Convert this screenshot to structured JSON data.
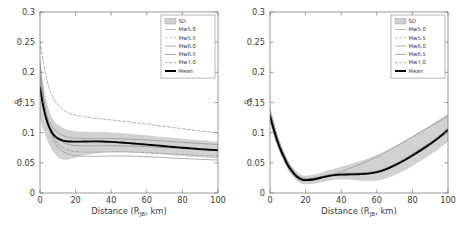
{
  "figure": {
    "background": "#ffffff",
    "panel_count": 2
  },
  "style": {
    "sd_band_color": "#b4b4b4",
    "mean_color": "#000000",
    "curve_color": "#9a9a9a",
    "axis_color": "#808080",
    "text_color": "#3a3a3a",
    "legend_border": "#9a9a9a"
  },
  "legend": {
    "position": "top-right",
    "entries": [
      {
        "label": "SD",
        "style": "band",
        "color": "#b4b4b4"
      },
      {
        "label": "Mw5.0",
        "style": "solid",
        "color": "#a8a8a8"
      },
      {
        "label": "Mw5.5",
        "style": "dashed",
        "color": "#a8a8a8"
      },
      {
        "label": "Mw6.0",
        "style": "solid",
        "color": "#9a9a9a"
      },
      {
        "label": "Mw6.5",
        "style": "solid",
        "color": "#8e8e8e"
      },
      {
        "label": "Mw7.0",
        "style": "dashed",
        "color": "#8e8e8e"
      },
      {
        "label": "Mean",
        "style": "thick-solid",
        "color": "#000000"
      }
    ]
  },
  "axes": {
    "x": {
      "label_main": "Distance (R",
      "label_sub": "JB",
      "label_tail": ", km)",
      "ticks": [
        0,
        20,
        40,
        60,
        80,
        100
      ],
      "tick_labels": [
        "0",
        "20",
        "40",
        "60",
        "80",
        "100"
      ],
      "min": 0,
      "max": 100
    },
    "y": {
      "label_symbol": "σ",
      "label_superscript": "2",
      "ticks": [
        0,
        0.05,
        0.1,
        0.15,
        0.2,
        0.25,
        0.3
      ],
      "tick_labels": [
        "0",
        "0.05",
        "0.1",
        "0.15",
        "0.2",
        "0.25",
        "0.3"
      ],
      "min": 0,
      "max": 0.3
    }
  },
  "chart_data": [
    {
      "type": "line",
      "panel": "left",
      "title": "",
      "xlabel": "Distance (RJB, km)",
      "ylabel": "σ²",
      "xlim": [
        0,
        100
      ],
      "ylim": [
        0,
        0.3
      ],
      "grid": false,
      "legend_position": "top-right",
      "x": [
        0,
        2,
        4,
        6,
        8,
        10,
        12,
        15,
        18,
        20,
        25,
        30,
        35,
        40,
        45,
        50,
        55,
        60,
        65,
        70,
        75,
        80,
        85,
        90,
        95,
        100
      ],
      "series": [
        {
          "name": "Mean",
          "style": "thick-solid",
          "values": [
            0.175,
            0.141,
            0.118,
            0.104,
            0.095,
            0.0905,
            0.0878,
            0.0858,
            0.0852,
            0.0851,
            0.0853,
            0.0855,
            0.0853,
            0.0847,
            0.0838,
            0.0827,
            0.0815,
            0.0802,
            0.0789,
            0.0776,
            0.0763,
            0.0751,
            0.0739,
            0.0728,
            0.0718,
            0.0709
          ]
        },
        {
          "name": "Mw5.0",
          "style": "solid",
          "values": [
            0.215,
            0.158,
            0.122,
            0.099,
            0.085,
            0.0762,
            0.0706,
            0.0654,
            0.0628,
            0.0619,
            0.0609,
            0.0608,
            0.0611,
            0.0613,
            0.0613,
            0.0611,
            0.0607,
            0.0602,
            0.0595,
            0.0588,
            0.058,
            0.0572,
            0.0565,
            0.0558,
            0.0552,
            0.0547
          ]
        },
        {
          "name": "Mw5.5",
          "style": "dashed",
          "values": [
            0.209,
            0.157,
            0.124,
            0.103,
            0.0901,
            0.0819,
            0.0766,
            0.0718,
            0.0694,
            0.0686,
            0.0678,
            0.0678,
            0.0681,
            0.0683,
            0.0683,
            0.068,
            0.0676,
            0.067,
            0.0663,
            0.0655,
            0.0647,
            0.0639,
            0.0631,
            0.0624,
            0.0617,
            0.0611
          ]
        },
        {
          "name": "Mw6.0",
          "style": "solid",
          "values": [
            0.196,
            0.152,
            0.125,
            0.108,
            0.0972,
            0.0903,
            0.0857,
            0.0815,
            0.0794,
            0.0787,
            0.078,
            0.0781,
            0.0783,
            0.0784,
            0.0783,
            0.078,
            0.0775,
            0.0768,
            0.076,
            0.0751,
            0.0742,
            0.0733,
            0.0724,
            0.0716,
            0.0708,
            0.0701
          ]
        },
        {
          "name": "Mw6.5",
          "style": "solid",
          "values": [
            0.182,
            0.148,
            0.127,
            0.114,
            0.1055,
            0.1001,
            0.0965,
            0.0932,
            0.0915,
            0.0909,
            0.0903,
            0.0903,
            0.0904,
            0.0903,
            0.09,
            0.0895,
            0.0888,
            0.088,
            0.087,
            0.086,
            0.085,
            0.084,
            0.083,
            0.082,
            0.0811,
            0.0803
          ]
        },
        {
          "name": "Mw7.0",
          "style": "dashed",
          "values": [
            0.251,
            0.214,
            0.186,
            0.167,
            0.1545,
            0.1462,
            0.1404,
            0.1344,
            0.1308,
            0.1292,
            0.1263,
            0.1243,
            0.1227,
            0.1211,
            0.1195,
            0.1178,
            0.116,
            0.1142,
            0.1123,
            0.1104,
            0.1085,
            0.1066,
            0.1047,
            0.1029,
            0.1012,
            0.0996
          ]
        }
      ],
      "sd_band": {
        "name": "SD",
        "upper": [
          0.228,
          0.178,
          0.148,
          0.13,
          0.1195,
          0.1132,
          0.1092,
          0.1052,
          0.1032,
          0.1025,
          0.1016,
          0.1013,
          0.1009,
          0.1002,
          0.0993,
          0.0982,
          0.0969,
          0.0956,
          0.0942,
          0.0928,
          0.0914,
          0.09,
          0.0887,
          0.0874,
          0.0862,
          0.0851
        ],
        "lower": [
          0.122,
          0.104,
          0.088,
          0.0755,
          0.0662,
          0.0597,
          0.0563,
          0.0551,
          0.0572,
          0.0585,
          0.0625,
          0.0652,
          0.0668,
          0.0675,
          0.0675,
          0.0671,
          0.0664,
          0.0655,
          0.0645,
          0.0634,
          0.0623,
          0.0612,
          0.0601,
          0.0591,
          0.0581,
          0.0572
        ]
      }
    },
    {
      "type": "line",
      "panel": "right",
      "title": "",
      "xlabel": "Distance (RJB, km)",
      "ylabel": "σ²",
      "xlim": [
        0,
        100
      ],
      "ylim": [
        0,
        0.3
      ],
      "grid": false,
      "legend_position": "top-right",
      "x": [
        0,
        2,
        4,
        6,
        8,
        10,
        12,
        15,
        18,
        20,
        25,
        30,
        35,
        40,
        45,
        50,
        55,
        60,
        65,
        70,
        75,
        80,
        85,
        90,
        95,
        100
      ],
      "series": [
        {
          "name": "Mean",
          "style": "thick-solid",
          "values": [
            0.128,
            0.1065,
            0.0875,
            0.0715,
            0.0585,
            0.0465,
            0.0375,
            0.0272,
            0.0222,
            0.0213,
            0.0228,
            0.0263,
            0.0292,
            0.0305,
            0.0308,
            0.0312,
            0.0322,
            0.0345,
            0.0392,
            0.0458,
            0.0535,
            0.0622,
            0.0715,
            0.0812,
            0.0922,
            0.1045
          ]
        },
        {
          "name": "Mw5.0",
          "style": "solid",
          "values": [
            0.122,
            0.1,
            0.0818,
            0.0665,
            0.0538,
            0.0428,
            0.0342,
            0.0248,
            0.0205,
            0.0198,
            0.0215,
            0.0258,
            0.0302,
            0.0352,
            0.0408,
            0.0468,
            0.0532,
            0.0602,
            0.0678,
            0.0758,
            0.0842,
            0.0928,
            0.1015,
            0.1102,
            0.1188,
            0.1268
          ]
        },
        {
          "name": "Mw5.5",
          "style": "dashed",
          "values": [
            0.141,
            0.1178,
            0.0968,
            0.0792,
            0.0645,
            0.0518,
            0.0418,
            0.0305,
            0.0248,
            0.0238,
            0.0252,
            0.0285,
            0.0312,
            0.0325,
            0.0328,
            0.0332,
            0.0342,
            0.0365,
            0.0412,
            0.0478,
            0.0558,
            0.0648,
            0.0742,
            0.0842,
            0.0952,
            0.1075
          ]
        },
        {
          "name": "Mw6.0",
          "style": "solid",
          "values": [
            0.132,
            0.1102,
            0.0905,
            0.0742,
            0.0605,
            0.0485,
            0.0392,
            0.0285,
            0.0232,
            0.0222,
            0.0238,
            0.0272,
            0.0302,
            0.0315,
            0.0318,
            0.0322,
            0.0332,
            0.0355,
            0.0402,
            0.0468,
            0.0545,
            0.0632,
            0.0725,
            0.0822,
            0.0932,
            0.1052
          ]
        },
        {
          "name": "Mw6.5",
          "style": "solid",
          "values": [
            0.124,
            0.1035,
            0.0852,
            0.0698,
            0.0568,
            0.0455,
            0.0368,
            0.0265,
            0.0215,
            0.0206,
            0.0222,
            0.0255,
            0.0285,
            0.0298,
            0.0302,
            0.0306,
            0.0315,
            0.0338,
            0.0382,
            0.0445,
            0.0522,
            0.0608,
            0.0698,
            0.0795,
            0.0902,
            0.1022
          ]
        },
        {
          "name": "Mw7.0",
          "style": "dashed",
          "values": [
            0.138,
            0.1152,
            0.0948,
            0.0778,
            0.0635,
            0.0512,
            0.0415,
            0.0302,
            0.0246,
            0.0236,
            0.025,
            0.0282,
            0.031,
            0.0322,
            0.0326,
            0.033,
            0.034,
            0.0362,
            0.0408,
            0.0472,
            0.055,
            0.0638,
            0.073,
            0.083,
            0.094,
            0.1062
          ]
        }
      ],
      "sd_band": {
        "name": "SD",
        "upper": [
          0.139,
          0.1168,
          0.0968,
          0.0802,
          0.0668,
          0.0552,
          0.0462,
          0.0352,
          0.0298,
          0.0288,
          0.0305,
          0.0348,
          0.0392,
          0.0435,
          0.0478,
          0.0522,
          0.0572,
          0.063,
          0.0698,
          0.0775,
          0.0858,
          0.0945,
          0.1035,
          0.1125,
          0.1218,
          0.1312
        ],
        "lower": [
          0.117,
          0.0962,
          0.0782,
          0.0628,
          0.0502,
          0.0388,
          0.0302,
          0.0202,
          0.0152,
          0.0145,
          0.0158,
          0.0188,
          0.0212,
          0.0222,
          0.0218,
          0.0208,
          0.0202,
          0.0208,
          0.024,
          0.0295,
          0.0365,
          0.0448,
          0.0538,
          0.0632,
          0.0735,
          0.0848
        ]
      }
    }
  ]
}
